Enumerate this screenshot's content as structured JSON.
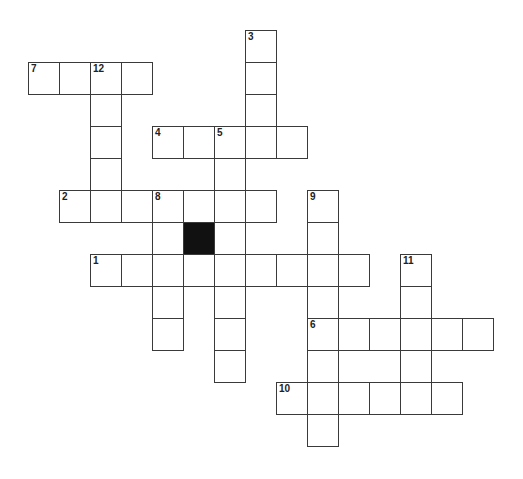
{
  "puzzle": {
    "origin_x": 28,
    "origin_y": 30,
    "cell_w": 31,
    "cell_h": 32,
    "colors": {
      "border": "#3a3a3a",
      "block": "#111111",
      "background": "#ffffff"
    },
    "words": [
      {
        "number": "1",
        "direction": "across",
        "row": 7,
        "col": 2,
        "length": 9
      },
      {
        "number": "2",
        "direction": "across",
        "row": 5,
        "col": 1,
        "length": 7
      },
      {
        "number": "3",
        "direction": "down",
        "row": 0,
        "col": 7,
        "length": 4
      },
      {
        "number": "4",
        "direction": "across",
        "row": 3,
        "col": 4,
        "length": 5
      },
      {
        "number": "5",
        "direction": "down",
        "row": 3,
        "col": 6,
        "length": 8
      },
      {
        "number": "6",
        "direction": "across",
        "row": 9,
        "col": 9,
        "length": 6
      },
      {
        "number": "7",
        "direction": "across",
        "row": 1,
        "col": 0,
        "length": 4
      },
      {
        "number": "8",
        "direction": "down",
        "row": 5,
        "col": 4,
        "length": 5
      },
      {
        "number": "9",
        "direction": "down",
        "row": 5,
        "col": 9,
        "length": 8
      },
      {
        "number": "10",
        "direction": "across",
        "row": 11,
        "col": 8,
        "length": 6
      },
      {
        "number": "11",
        "direction": "down",
        "row": 7,
        "col": 12,
        "length": 5
      },
      {
        "number": "12",
        "direction": "down",
        "row": 1,
        "col": 2,
        "length": 5
      }
    ],
    "black_cells": [
      {
        "row": 6,
        "col": 5
      }
    ]
  }
}
